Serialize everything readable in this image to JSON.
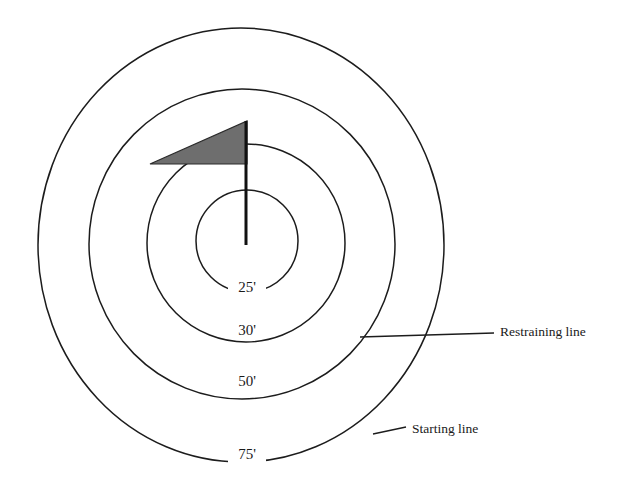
{
  "diagram": {
    "type": "concentric-range-target",
    "title": "",
    "background_color": "#ffffff",
    "stroke_color": "#1c1c1c",
    "text_color": "#1a1a1a",
    "flag": {
      "name": "flag-marker",
      "banner_fill_color": "#6e6e6e",
      "banner_stroke_color": "#2a2a2a",
      "pole_color": "#111111"
    },
    "rings": [
      {
        "id": "ring-25",
        "label": "25'",
        "distance_feet": 25,
        "label_x": 247,
        "label_y": 291,
        "cx": 247,
        "cy": 241,
        "rx": 51,
        "ry": 51,
        "stroke_width": 1.5
      },
      {
        "id": "ring-30",
        "label": "30'",
        "distance_feet": 30,
        "label_x": 247,
        "label_y": 334,
        "cx": 246,
        "cy": 243,
        "rx": 99,
        "ry": 99,
        "stroke_width": 1.5
      },
      {
        "id": "ring-50",
        "label": "50'",
        "distance_feet": 50,
        "label_x": 247,
        "label_y": 385,
        "cx": 242,
        "cy": 244,
        "rx": 153,
        "ry": 155,
        "stroke_width": 1.5
      },
      {
        "id": "ring-75",
        "label": "75'",
        "distance_feet": 75,
        "label_x": 247,
        "label_y": 458,
        "cx": 241,
        "cy": 245,
        "rx": 203,
        "ry": 217,
        "stroke_width": 1.5
      }
    ],
    "callouts": [
      {
        "id": "callout-restraining-line",
        "label": "Restraining line",
        "points_to_ring": "ring-50",
        "text_x": 500,
        "text_y": 333,
        "leader_x1": 360,
        "leader_y1": 337,
        "leader_x2": 494,
        "leader_y2": 333
      },
      {
        "id": "callout-starting-line",
        "label": "Starting line",
        "points_to_ring": "ring-75",
        "text_x": 412,
        "text_y": 430,
        "leader_x1": 373,
        "leader_y1": 433,
        "leader_x2": 406,
        "leader_y2": 428
      }
    ]
  }
}
